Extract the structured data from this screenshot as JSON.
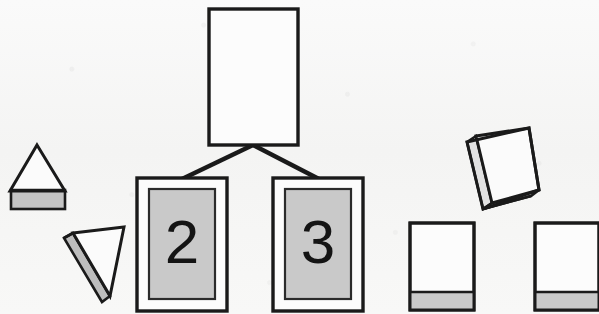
{
  "figure": {
    "background_color": "#f7f7f6",
    "ink_color": "#1a1a1a",
    "fill_gray": "#c9c9c9",
    "face_gray": "#bdbdbd",
    "white": "#fcfcfc",
    "title": "",
    "shapes": {
      "upright_triangular_prism": {
        "label": "upright triangular prism",
        "apex": "x=37,y=146",
        "base_left": "x=12,y=190",
        "base_right": "x=64,y=190",
        "base_slab_height": 18
      },
      "tilted_triangular_wedge": {
        "label": "tilted triangular wedge",
        "orientation": "apex pointing down-right"
      },
      "root_rectangle": {
        "label": "blank root rectangle",
        "x": 208,
        "y": 8,
        "width": 90,
        "height": 138,
        "fill": "white",
        "text": ""
      },
      "connector_left": {
        "label": "connector root to card 2",
        "from": "x=253,y=146",
        "to": "x=183,y=178"
      },
      "connector_right": {
        "label": "connector root to card 3",
        "from": "x=253,y=146",
        "to": "x=318,y=178"
      },
      "card_2": {
        "label": "card two",
        "digit": "2",
        "x": 136,
        "y": 177,
        "width": 92,
        "height": 135,
        "panel_fill": "#c9c9c9"
      },
      "card_3": {
        "label": "card three",
        "digit": "3",
        "x": 272,
        "y": 177,
        "width": 92,
        "height": 135,
        "panel_fill": "#c9c9c9"
      },
      "tilted_box": {
        "label": "tilted 3d slab box",
        "rotation_degrees": -15,
        "band_fill": "#c9c9c9"
      },
      "flat_box_left": {
        "label": "flat box left",
        "x": 409,
        "y": 222,
        "width": 65,
        "height": 88,
        "band_height": 16,
        "band_fill": "#c9c9c9"
      },
      "flat_box_right": {
        "label": "flat box right",
        "x": 534,
        "y": 222,
        "width": 65,
        "height": 88,
        "band_height": 16,
        "band_fill": "#c9c9c9"
      }
    }
  }
}
